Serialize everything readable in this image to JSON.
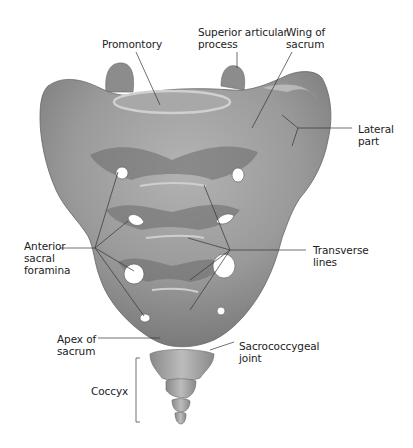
{
  "diagram": {
    "colors": {
      "bone": "#9a9a9a",
      "bone_light": "#bdbdbd",
      "bone_dark": "#6e6e6e",
      "leader_line": "#333333",
      "text": "#222222",
      "background": "#ffffff"
    },
    "labels": {
      "promontory": "Promontory",
      "superior_articular_process": "Superior articular\nprocess",
      "wing_of_sacrum": "Wing of\nsacrum",
      "lateral_part": "Lateral\npart",
      "anterior_sacral_foramina": "Anterior\nsacral\nforamina",
      "transverse_lines": "Transverse\nlines",
      "apex_of_sacrum": "Apex of\nsacrum",
      "sacrococcygeal_joint": "Sacrococcygeal\njoint",
      "coccyx": "Coccyx"
    }
  }
}
